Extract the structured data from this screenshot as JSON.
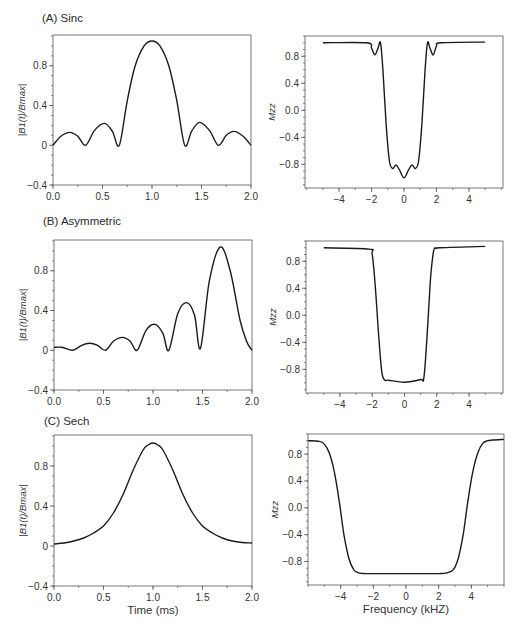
{
  "figure": {
    "panels": [
      {
        "id": "A",
        "title": "(A) Sinc"
      },
      {
        "id": "B",
        "title": "(B) Asymmetric"
      },
      {
        "id": "C",
        "title": "(C) Sech"
      }
    ],
    "left_ylabel": "|B1(t)/Bmax|",
    "right_ylabel": "Mzz",
    "bottom_left_xlabel": "Time (ms)",
    "bottom_right_xlabel": "Frequency (kHZ)",
    "line_color": "#1a1a1a",
    "axis_color": "#555555"
  },
  "chart_data": [
    {
      "panel": "A-left",
      "type": "line",
      "title": "(A) Sinc",
      "xlabel": "",
      "ylabel": "|B1(t)/Bmax|",
      "xlim": [
        0,
        2
      ],
      "ylim": [
        -0.4,
        1.11
      ],
      "xticks": [
        0.0,
        0.5,
        1.0,
        1.5,
        2.0
      ],
      "xticklabels": [
        "0.0",
        "0.5",
        "1.0",
        "1.5",
        "2.0"
      ],
      "yticks": [
        -0.4,
        0,
        0.4,
        0.8
      ],
      "yticklabels": [
        "−0.4",
        "0",
        "0.4",
        "0.8"
      ],
      "x": [
        0.0,
        0.08,
        0.17,
        0.25,
        0.33,
        0.42,
        0.52,
        0.6,
        0.67,
        0.75,
        0.83,
        0.92,
        1.0,
        1.08,
        1.17,
        1.25,
        1.33,
        1.4,
        1.48,
        1.58,
        1.67,
        1.75,
        1.83,
        1.92,
        2.0
      ],
      "y": [
        0.0,
        0.09,
        0.13,
        0.09,
        0.0,
        0.15,
        0.22,
        0.14,
        0.0,
        0.45,
        0.8,
        1.0,
        1.05,
        1.0,
        0.8,
        0.45,
        0.0,
        0.14,
        0.23,
        0.15,
        0.0,
        0.1,
        0.14,
        0.09,
        0.0
      ]
    },
    {
      "panel": "A-right",
      "type": "line",
      "title": "",
      "xlabel": "",
      "ylabel": "Mzz",
      "xlim": [
        -6.1,
        6.1
      ],
      "ylim": [
        -1.15,
        1.1
      ],
      "xticks": [
        -4,
        -2,
        0,
        2,
        4
      ],
      "xticklabels": [
        "−4",
        "−2",
        "0",
        "2",
        "4"
      ],
      "yticks": [
        -0.8,
        -0.4,
        0.0,
        0.4,
        0.8
      ],
      "yticklabels": [
        "−0.8",
        "−0.4",
        "0.0",
        "0.4",
        "0.8"
      ],
      "x": [
        -5.0,
        -2.3,
        -2.0,
        -1.8,
        -1.6,
        -1.45,
        -1.3,
        -1.1,
        -0.9,
        -0.7,
        -0.5,
        -0.3,
        0.0,
        0.3,
        0.5,
        0.7,
        0.9,
        1.1,
        1.3,
        1.45,
        1.6,
        1.8,
        2.0,
        2.3,
        5.0
      ],
      "y": [
        1.0,
        1.0,
        0.92,
        0.82,
        0.92,
        1.0,
        0.6,
        -0.2,
        -0.75,
        -0.86,
        -0.81,
        -0.87,
        -1.0,
        -0.87,
        -0.81,
        -0.86,
        -0.75,
        -0.2,
        0.6,
        1.0,
        0.92,
        0.82,
        0.95,
        1.0,
        1.01
      ]
    },
    {
      "panel": "B-left",
      "type": "line",
      "title": "(B) Asymmetric",
      "xlabel": "",
      "ylabel": "|B1(t)/Bmax|",
      "xlim": [
        0,
        2
      ],
      "ylim": [
        -0.4,
        1.11
      ],
      "xticks": [
        0.0,
        0.5,
        1.0,
        1.5,
        2.0
      ],
      "xticklabels": [
        "0.0",
        "0.5",
        "1.0",
        "1.5",
        "2.0"
      ],
      "yticks": [
        -0.4,
        0,
        0.4,
        0.8
      ],
      "yticklabels": [
        "−0.4",
        "0",
        "0.4",
        "0.8"
      ],
      "x": [
        0.0,
        0.08,
        0.19,
        0.28,
        0.36,
        0.44,
        0.52,
        0.6,
        0.69,
        0.77,
        0.84,
        0.93,
        1.02,
        1.1,
        1.16,
        1.25,
        1.34,
        1.42,
        1.48,
        1.57,
        1.68,
        1.78,
        1.88,
        1.95,
        2.0
      ],
      "y": [
        0.03,
        0.03,
        0.0,
        0.05,
        0.07,
        0.05,
        0.0,
        0.09,
        0.13,
        0.09,
        0.0,
        0.2,
        0.26,
        0.17,
        0.0,
        0.37,
        0.48,
        0.35,
        0.02,
        0.7,
        1.04,
        0.8,
        0.3,
        0.08,
        0.0
      ]
    },
    {
      "panel": "B-right",
      "type": "line",
      "title": "",
      "xlabel": "",
      "ylabel": "Mzz",
      "xlim": [
        -6.1,
        6.1
      ],
      "ylim": [
        -1.15,
        1.1
      ],
      "xticks": [
        -4,
        -2,
        0,
        2,
        4
      ],
      "xticklabels": [
        "−4",
        "−2",
        "0",
        "2",
        "4"
      ],
      "yticks": [
        -0.8,
        -0.4,
        0.0,
        0.4,
        0.8
      ],
      "yticklabels": [
        "−0.8",
        "−0.4",
        "0.0",
        "0.4",
        "0.8"
      ],
      "x": [
        -5.0,
        -2.2,
        -2.0,
        -1.8,
        -1.6,
        -1.4,
        -1.2,
        -1.0,
        0.0,
        1.0,
        1.2,
        1.4,
        1.6,
        1.8,
        2.0,
        2.2,
        5.0
      ],
      "y": [
        1.0,
        0.98,
        0.9,
        0.4,
        -0.3,
        -0.85,
        -0.96,
        -0.96,
        -0.99,
        -0.95,
        -0.92,
        -0.3,
        0.5,
        0.95,
        0.99,
        1.0,
        1.02
      ]
    },
    {
      "panel": "C-left",
      "type": "line",
      "title": "(C) Sech",
      "xlabel": "Time (ms)",
      "ylabel": "|B1(t)/Bmax|",
      "xlim": [
        0,
        2
      ],
      "ylim": [
        -0.4,
        1.11
      ],
      "xticks": [
        0.0,
        0.5,
        1.0,
        1.5,
        2.0
      ],
      "xticklabels": [
        "0.0",
        "0.5",
        "1.0",
        "1.5",
        "2.0"
      ],
      "yticks": [
        -0.4,
        0,
        0.4,
        0.8
      ],
      "yticklabels": [
        "−0.4",
        "0",
        "0.4",
        "0.8"
      ],
      "x": [
        0.0,
        0.1,
        0.2,
        0.3,
        0.4,
        0.5,
        0.6,
        0.7,
        0.8,
        0.9,
        0.95,
        1.0,
        1.05,
        1.1,
        1.2,
        1.3,
        1.4,
        1.5,
        1.6,
        1.7,
        1.8,
        1.9,
        2.0
      ],
      "y": [
        0.02,
        0.03,
        0.05,
        0.08,
        0.13,
        0.2,
        0.33,
        0.52,
        0.76,
        0.96,
        1.01,
        1.03,
        1.01,
        0.96,
        0.76,
        0.52,
        0.33,
        0.2,
        0.13,
        0.08,
        0.05,
        0.035,
        0.03
      ]
    },
    {
      "panel": "C-right",
      "type": "line",
      "title": "",
      "xlabel": "Frequency (kHZ)",
      "ylabel": "Mzz",
      "xlim": [
        -6.0,
        6.0
      ],
      "ylim": [
        -1.15,
        1.1
      ],
      "xticks": [
        -4,
        -2,
        0,
        2,
        4
      ],
      "xticklabels": [
        "−4",
        "−2",
        "0",
        "2",
        "4"
      ],
      "yticks": [
        -0.8,
        -0.4,
        0.0,
        0.4,
        0.8
      ],
      "yticklabels": [
        "−0.8",
        "−0.4",
        "0.0",
        "0.4",
        "0.8"
      ],
      "x": [
        -6.0,
        -5.3,
        -5.0,
        -4.7,
        -4.4,
        -4.1,
        -3.8,
        -3.5,
        -3.2,
        -2.9,
        -2.5,
        -2.0,
        0.0,
        2.0,
        2.5,
        2.9,
        3.2,
        3.5,
        3.8,
        4.1,
        4.4,
        4.7,
        5.0,
        5.3,
        6.0
      ],
      "y": [
        1.0,
        0.99,
        0.95,
        0.82,
        0.55,
        0.12,
        -0.4,
        -0.75,
        -0.92,
        -0.97,
        -0.98,
        -0.98,
        -0.98,
        -0.98,
        -0.97,
        -0.92,
        -0.75,
        -0.4,
        0.12,
        0.55,
        0.82,
        0.96,
        1.0,
        1.01,
        1.02
      ]
    }
  ]
}
